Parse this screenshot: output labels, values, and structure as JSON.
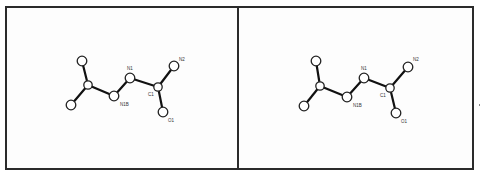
{
  "figure": {
    "type": "stereo-pair molecular structure",
    "panels": [
      {
        "id": "left",
        "atoms": [
          {
            "id": "A1",
            "label": "",
            "x": 82,
            "y": 61
          },
          {
            "id": "A2",
            "label": "",
            "x": 88,
            "y": 85
          },
          {
            "id": "A3",
            "label": "",
            "x": 71,
            "y": 105
          },
          {
            "id": "N1B",
            "label": "N1B",
            "x": 114,
            "y": 96,
            "lx": 120,
            "ly": 106
          },
          {
            "id": "N1",
            "label": "N1",
            "x": 130,
            "y": 78,
            "lx": 127,
            "ly": 70
          },
          {
            "id": "C1",
            "label": "C1",
            "x": 158,
            "y": 87,
            "lx": 148,
            "ly": 96
          },
          {
            "id": "N2",
            "label": "N2",
            "x": 174,
            "y": 66,
            "lx": 179,
            "ly": 61
          },
          {
            "id": "O1",
            "label": "O1",
            "x": 163,
            "y": 112,
            "lx": 168,
            "ly": 122
          }
        ]
      },
      {
        "id": "right",
        "atoms": [
          {
            "id": "A1",
            "label": "",
            "x": 316,
            "y": 61
          },
          {
            "id": "A2",
            "label": "",
            "x": 320,
            "y": 86
          },
          {
            "id": "A3",
            "label": "",
            "x": 304,
            "y": 106
          },
          {
            "id": "N1B",
            "label": "N1B",
            "x": 347,
            "y": 97,
            "lx": 353,
            "ly": 107
          },
          {
            "id": "N1",
            "label": "N1",
            "x": 364,
            "y": 78,
            "lx": 361,
            "ly": 70
          },
          {
            "id": "C1",
            "label": "C1",
            "x": 390,
            "y": 88,
            "lx": 380,
            "ly": 97
          },
          {
            "id": "N2",
            "label": "N2",
            "x": 408,
            "y": 67,
            "lx": 413,
            "ly": 61
          },
          {
            "id": "O1",
            "label": "O1",
            "x": 396,
            "y": 113,
            "lx": 401,
            "ly": 123
          }
        ]
      }
    ],
    "bonds": [
      [
        "A1",
        "A2"
      ],
      [
        "A2",
        "A3"
      ],
      [
        "A2",
        "N1B"
      ],
      [
        "N1B",
        "N1"
      ],
      [
        "N1",
        "C1"
      ],
      [
        "C1",
        "N2"
      ],
      [
        "C1",
        "O1"
      ]
    ],
    "labels": {
      "n1b": "N1B",
      "n1": "N1",
      "c1": "C1",
      "n2": "N2",
      "o1": "O1"
    },
    "colors": {
      "border": "#2b2b2b",
      "bond": "#111111",
      "atom_fill": "#ffffff"
    }
  }
}
